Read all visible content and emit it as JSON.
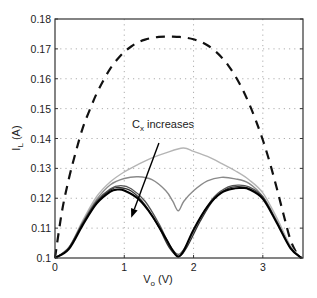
{
  "chart_data": {
    "type": "line",
    "title": "",
    "xlabel": "V_o (V)",
    "ylabel": "I_L (A)",
    "xlim": [
      0,
      3.58
    ],
    "ylim": [
      0.1,
      0.18
    ],
    "grid": true,
    "grid_style": "dotted",
    "xticks": [
      0,
      1,
      2,
      3
    ],
    "yticks": [
      0.1,
      0.11,
      0.12,
      0.13,
      0.14,
      0.15,
      0.16,
      0.17,
      0.18
    ],
    "xtick_labels": [
      "0",
      "1",
      "2",
      "3"
    ],
    "ytick_labels": [
      "0.1",
      "0.11",
      "0.12",
      "0.13",
      "0.14",
      "0.15",
      "0.16",
      "0.17",
      "0.18"
    ],
    "annotation": {
      "text_main": "C",
      "text_sub": "x",
      "text_rest": " increases",
      "arrow_from": [
        1.5,
        0.1385
      ],
      "arrow_to": [
        1.1,
        0.1135
      ]
    },
    "series": [
      {
        "name": "dashed reference",
        "style": "dashed",
        "color": "#111111",
        "width": 2.2,
        "x": [
          0,
          0.1,
          0.2,
          0.3,
          0.4,
          0.5,
          0.6,
          0.7,
          0.8,
          0.9,
          1.0,
          1.1,
          1.2,
          1.3,
          1.4,
          1.5,
          1.6,
          1.7,
          1.8,
          1.9,
          2.0,
          2.1,
          2.2,
          2.3,
          2.4,
          2.5,
          2.6,
          2.7,
          2.8,
          2.9,
          3.0,
          3.1,
          3.2,
          3.3,
          3.4,
          3.5,
          3.56
        ],
        "y": [
          0.1,
          0.1155,
          0.1265,
          0.1355,
          0.1435,
          0.1495,
          0.155,
          0.1595,
          0.1635,
          0.1665,
          0.169,
          0.1708,
          0.1722,
          0.1731,
          0.1737,
          0.174,
          0.1741,
          0.1741,
          0.174,
          0.1737,
          0.1732,
          0.1724,
          0.1712,
          0.1695,
          0.1673,
          0.1645,
          0.161,
          0.1568,
          0.1518,
          0.146,
          0.1395,
          0.132,
          0.1235,
          0.1145,
          0.106,
          0.1012,
          0.1
        ]
      },
      {
        "name": "light gray (small Cx)",
        "style": "solid",
        "color": "#b5b5b5",
        "width": 1.4,
        "x": [
          0,
          0.2,
          0.4,
          0.6,
          0.8,
          1.0,
          1.2,
          1.4,
          1.6,
          1.85,
          2.0,
          2.2,
          2.4,
          2.6,
          2.8,
          3.0,
          3.2,
          3.4,
          3.56
        ],
        "y": [
          0.1,
          0.1035,
          0.1125,
          0.1205,
          0.1255,
          0.1288,
          0.1313,
          0.1335,
          0.1352,
          0.1368,
          0.1357,
          0.134,
          0.1317,
          0.1292,
          0.1262,
          0.1218,
          0.1135,
          0.104,
          0.1
        ]
      },
      {
        "name": "mid gray",
        "style": "solid",
        "color": "#8a8a8a",
        "width": 1.4,
        "x": [
          0,
          0.2,
          0.4,
          0.6,
          0.8,
          1.0,
          1.2,
          1.4,
          1.6,
          1.7,
          1.78,
          1.86,
          2.0,
          2.2,
          2.4,
          2.6,
          2.8,
          3.0,
          3.2,
          3.4,
          3.56
        ],
        "y": [
          0.1,
          0.1035,
          0.112,
          0.1195,
          0.1245,
          0.1266,
          0.1272,
          0.1262,
          0.1225,
          0.119,
          0.1158,
          0.119,
          0.1225,
          0.1258,
          0.127,
          0.1265,
          0.125,
          0.1205,
          0.1125,
          0.1035,
          0.1
        ]
      },
      {
        "name": "dark gray 1",
        "style": "solid",
        "color": "#555555",
        "width": 1.3,
        "x": [
          0,
          0.2,
          0.4,
          0.6,
          0.8,
          0.95,
          1.1,
          1.3,
          1.5,
          1.65,
          1.78,
          1.9,
          2.1,
          2.3,
          2.5,
          2.65,
          2.8,
          3.0,
          3.2,
          3.4,
          3.56
        ],
        "y": [
          0.1,
          0.1035,
          0.1118,
          0.119,
          0.1232,
          0.1242,
          0.1232,
          0.119,
          0.1115,
          0.1045,
          0.1012,
          0.1045,
          0.1135,
          0.1205,
          0.1238,
          0.1244,
          0.1238,
          0.1205,
          0.1122,
          0.1035,
          0.1
        ]
      },
      {
        "name": "dark gray 2",
        "style": "solid",
        "color": "#333333",
        "width": 1.3,
        "x": [
          0,
          0.2,
          0.4,
          0.6,
          0.8,
          0.92,
          1.1,
          1.3,
          1.5,
          1.65,
          1.78,
          1.9,
          2.1,
          2.3,
          2.5,
          2.65,
          2.8,
          3.0,
          3.2,
          3.4,
          3.56
        ],
        "y": [
          0.1,
          0.1033,
          0.1115,
          0.1187,
          0.1228,
          0.1236,
          0.1224,
          0.1178,
          0.1102,
          0.1035,
          0.1006,
          0.1035,
          0.1125,
          0.1198,
          0.1233,
          0.1239,
          0.1233,
          0.1202,
          0.112,
          0.1034,
          0.1
        ]
      },
      {
        "name": "black (large Cx)",
        "style": "solid",
        "color": "#000000",
        "width": 2.0,
        "x": [
          0,
          0.2,
          0.4,
          0.6,
          0.8,
          0.9,
          1.0,
          1.2,
          1.4,
          1.6,
          1.7,
          1.78,
          1.86,
          2.0,
          2.2,
          2.4,
          2.6,
          2.7,
          2.8,
          3.0,
          3.2,
          3.4,
          3.56
        ],
        "y": [
          0.1,
          0.103,
          0.111,
          0.1182,
          0.1222,
          0.1229,
          0.1226,
          0.1198,
          0.1142,
          0.1065,
          0.1025,
          0.1004,
          0.1025,
          0.1095,
          0.1172,
          0.1218,
          0.1233,
          0.1234,
          0.123,
          0.1198,
          0.1118,
          0.1032,
          0.1
        ]
      }
    ]
  },
  "axes": {
    "xlabel_main": "V",
    "xlabel_sub": "o",
    "xlabel_rest": " (V)",
    "ylabel_main": "I",
    "ylabel_sub": "L",
    "ylabel_rest": " (A)"
  }
}
